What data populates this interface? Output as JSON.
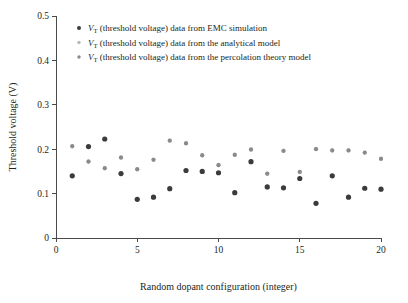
{
  "figure": {
    "background": "#ffffff",
    "axis_color": "#4a4a4a",
    "text_color": "#231f20"
  },
  "axes": {
    "x_title": "Random dopant configuration (integer)",
    "y_title": "Threshold voltage (V)",
    "x_ticks": [
      "0",
      "5",
      "10",
      "15",
      "20"
    ],
    "y_ticks": [
      "0",
      "0.1",
      "0.2",
      "0.3",
      "0.4",
      "0.5"
    ]
  },
  "legend": {
    "entries": [
      {
        "symbol_color": "#3b3b3b",
        "var_name": "V",
        "var_sub": "T",
        "text": " (threshold voltage) data from EMC simulation"
      },
      {
        "symbol_color": "#b9b9b9",
        "var_name": "V",
        "var_sub": "T",
        "text": " (threshold voltage) data from the analytical model"
      },
      {
        "symbol_color": "#8a8a8a",
        "var_name": "V",
        "var_sub": "T",
        "text": " (threshold voltage) data from the percolation theory model"
      }
    ]
  },
  "chart_data": {
    "type": "scatter",
    "title": "",
    "xlabel": "Random dopant configuration (integer)",
    "ylabel": "Threshold voltage (V)",
    "xlim": [
      0,
      20
    ],
    "ylim": [
      0,
      0.5
    ],
    "xticks": [
      0,
      5,
      10,
      15,
      20
    ],
    "yticks": [
      0,
      0.1,
      0.2,
      0.3,
      0.4,
      0.5
    ],
    "grid": false,
    "legend_position": "upper-left-inside",
    "x": [
      1,
      2,
      3,
      4,
      5,
      6,
      7,
      8,
      9,
      10,
      11,
      12,
      13,
      14,
      15,
      16,
      17,
      18,
      19,
      20
    ],
    "series": [
      {
        "name": "V_T (threshold voltage) data from EMC simulation",
        "color": "#3b3b3b",
        "marker": "circle",
        "marker_size": 5.2,
        "values": [
          0.14,
          0.206,
          0.223,
          0.145,
          0.087,
          0.092,
          0.111,
          0.152,
          0.15,
          0.147,
          0.102,
          0.172,
          0.115,
          0.113,
          0.134,
          0.078,
          0.14,
          0.092,
          0.112,
          0.11
        ]
      },
      {
        "name": "V_T (threshold voltage) data from the analytical model",
        "color": "#b9b9b9",
        "marker": "circle",
        "marker_size": 4.0,
        "values": [
          0.206,
          0.173,
          0.158,
          0.182,
          0.154,
          0.177,
          0.22,
          0.214,
          0.187,
          0.165,
          0.188,
          0.2,
          0.144,
          0.197,
          0.148,
          0.201,
          0.198,
          0.198,
          0.193,
          0.179
        ]
      },
      {
        "name": "V_T (threshold voltage) data from the percolation theory model",
        "color": "#8a8a8a",
        "marker": "circle",
        "marker_size": 4.2,
        "values": [
          0.207,
          0.172,
          0.157,
          0.181,
          0.155,
          0.176,
          0.219,
          0.213,
          0.186,
          0.164,
          0.187,
          0.199,
          0.145,
          0.196,
          0.149,
          0.2,
          0.197,
          0.197,
          0.192,
          0.178
        ]
      }
    ]
  }
}
